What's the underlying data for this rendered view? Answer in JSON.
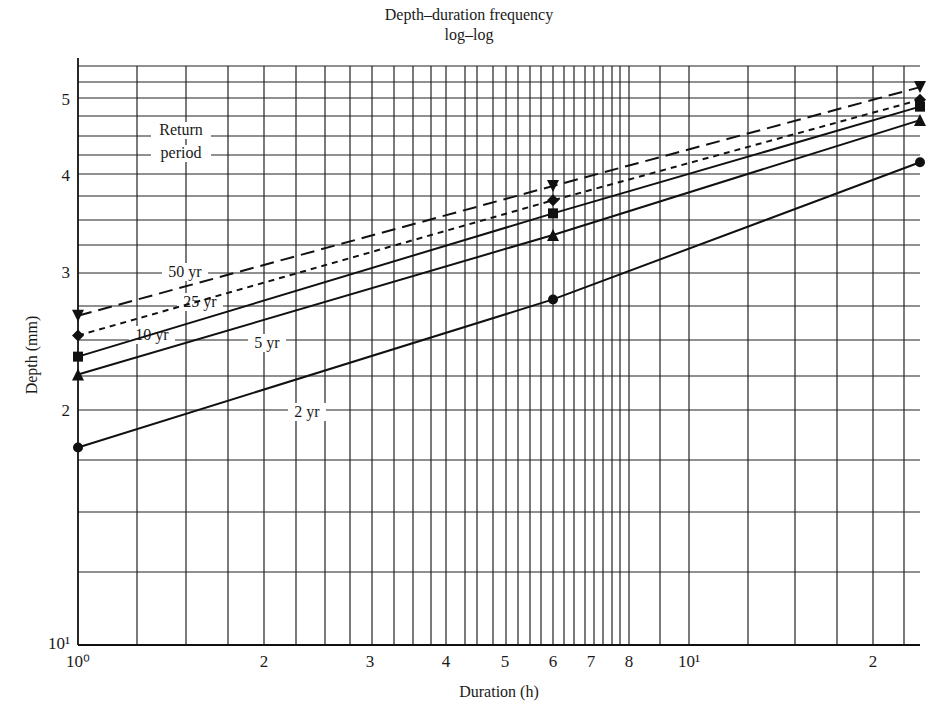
{
  "title": "Depth–duration frequency",
  "subtitle": "log–log",
  "xlabel": "Duration (h)",
  "ylabel": "Depth (mm)",
  "legend_title": [
    "Return",
    "period"
  ],
  "chart_data": {
    "type": "line",
    "xlabel": "Duration (h)",
    "ylabel": "Depth (mm)",
    "xscale": "log",
    "yscale": "log",
    "xlim": [
      1,
      24
    ],
    "ylim": [
      10,
      55
    ],
    "grid": true,
    "x_tick_labels": [
      {
        "value": 1,
        "label": "10⁰"
      },
      {
        "value": 2,
        "label": "2"
      },
      {
        "value": 3,
        "label": "3"
      },
      {
        "value": 4,
        "label": "4"
      },
      {
        "value": 5,
        "label": "5"
      },
      {
        "value": 6,
        "label": "6"
      },
      {
        "value": 7,
        "label": "7"
      },
      {
        "value": 8,
        "label": "8"
      },
      {
        "value": 10,
        "label": "10¹"
      },
      {
        "value": 20,
        "label": "2"
      }
    ],
    "y_tick_labels": [
      {
        "value": 10,
        "label": "10¹"
      },
      {
        "value": 20,
        "label": "2"
      },
      {
        "value": 30,
        "label": "3"
      },
      {
        "value": 40,
        "label": "4"
      },
      {
        "value": 50,
        "label": "5"
      }
    ],
    "x": [
      1,
      6,
      24
    ],
    "series": [
      {
        "name": "50 yr",
        "values": [
          26.4,
          38.7,
          51.8
        ],
        "line_style": "long-dash",
        "marker": "inverted-triangle"
      },
      {
        "name": "25 yr",
        "values": [
          24.9,
          37.1,
          49.9
        ],
        "line_style": "short-dash",
        "marker": "diamond"
      },
      {
        "name": "10 yr",
        "values": [
          23.4,
          35.7,
          48.9
        ],
        "line_style": "solid",
        "marker": "square"
      },
      {
        "name": "5 yr",
        "values": [
          22.2,
          33.5,
          47.0
        ],
        "line_style": "solid",
        "marker": "triangle"
      },
      {
        "name": "2 yr",
        "values": [
          17.9,
          27.7,
          41.5
        ],
        "line_style": "solid",
        "marker": "circle"
      }
    ],
    "annotations": [
      "Return period",
      "50 yr",
      "25 yr",
      "10 yr",
      "5 yr",
      "2 yr"
    ]
  },
  "layout": {
    "plot": {
      "left": 78,
      "right": 920,
      "top": 66,
      "bottom": 645
    },
    "y_px_at_10": 645,
    "y_px_per_decade": 781,
    "x_map": [
      [
        1,
        78
      ],
      [
        2,
        264
      ],
      [
        3,
        370
      ],
      [
        4,
        446
      ],
      [
        5,
        505
      ],
      [
        6,
        553
      ],
      [
        7,
        591
      ],
      [
        8,
        629
      ],
      [
        10,
        689
      ],
      [
        20,
        873
      ],
      [
        24,
        920
      ]
    ],
    "v_grid_px": [
      137,
      186,
      228,
      264,
      296,
      325,
      350,
      372,
      394,
      413,
      431,
      446,
      465,
      477,
      493,
      506,
      518,
      530,
      541,
      553,
      564,
      574,
      585,
      594,
      603,
      612,
      620,
      629,
      660,
      689,
      748,
      795,
      837,
      873,
      904
    ],
    "h_grid_px": [
      66,
      82,
      98,
      116,
      136,
      155,
      174,
      196,
      220,
      245,
      273,
      306,
      340,
      376,
      410,
      460,
      512,
      572
    ],
    "label_pos": {
      "50 yr": [
        185,
        277
      ],
      "25 yr": [
        200,
        307
      ],
      "10 yr": [
        152,
        340
      ],
      "5 yr": [
        267,
        348
      ],
      "2 yr": [
        307,
        417
      ]
    },
    "return_period_pos": [
      181,
      135,
      158
    ]
  }
}
